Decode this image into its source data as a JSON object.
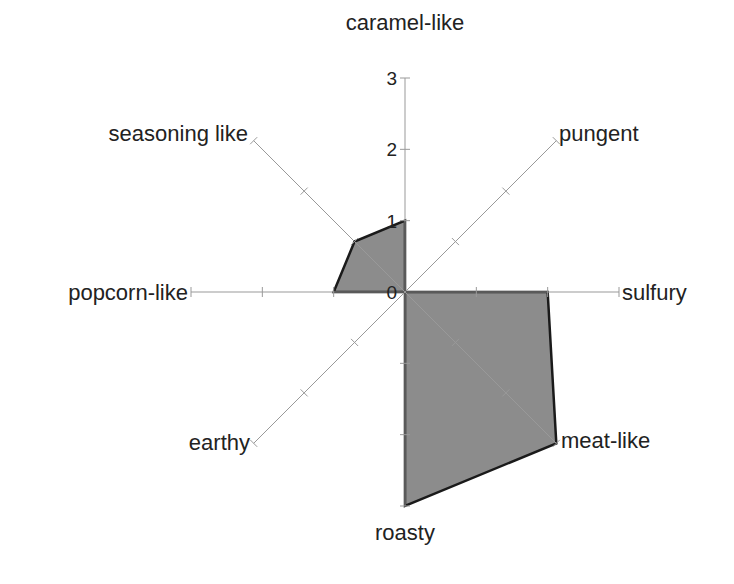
{
  "chart_data": {
    "type": "radar",
    "title": "",
    "axes": [
      "caramel-like",
      "pungent",
      "sulfury",
      "meat-like",
      "roasty",
      "earthy",
      "popcorn-like",
      "seasoning like"
    ],
    "series": [
      {
        "name": "",
        "values": [
          1,
          0,
          2,
          3,
          3,
          0,
          1,
          1
        ],
        "fill": "#8c8c8c",
        "stroke": "#1a1a1a"
      }
    ],
    "rlim": [
      0,
      3
    ],
    "tick_labels": [
      "0",
      "1",
      "2",
      "3"
    ],
    "grid": false,
    "legend": "none"
  },
  "colors": {
    "axis": "#999999",
    "fill": "#8c8c8c",
    "stroke": "#1a1a1a",
    "text": "#222222"
  }
}
